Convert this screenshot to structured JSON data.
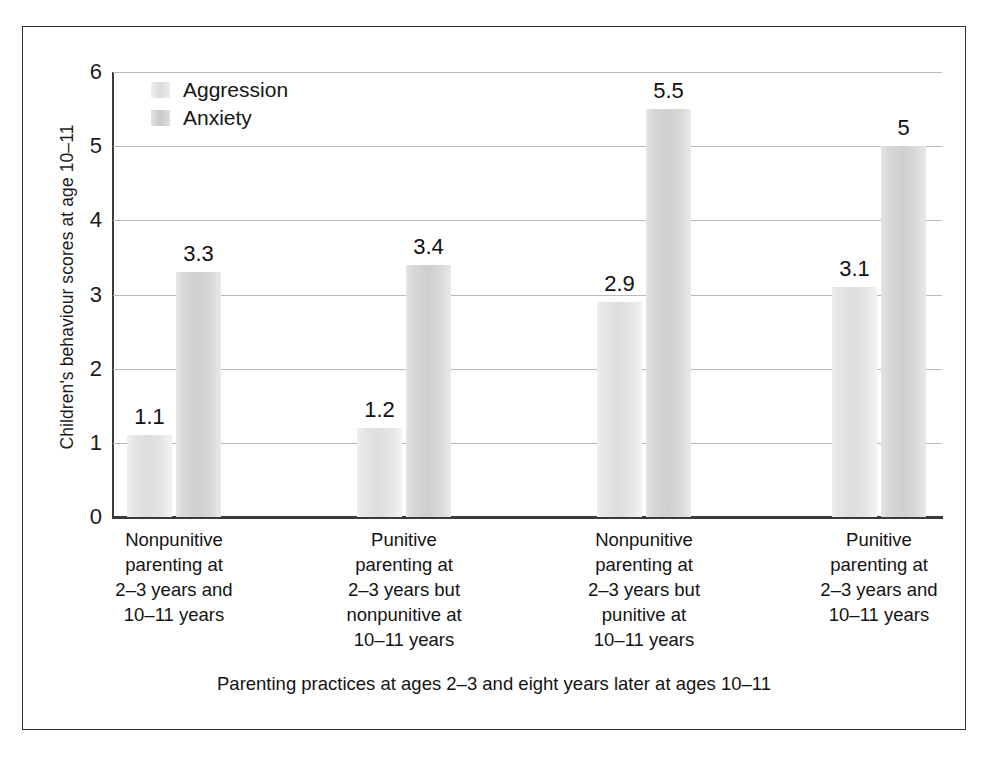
{
  "chart_data": {
    "type": "bar",
    "title": "",
    "xlabel": "Parenting practices at ages 2–3 and eight years later at ages 10–11",
    "ylabel": "Children's behaviour scores at age 10–11",
    "ylim": [
      0,
      6
    ],
    "yticks": [
      "0",
      "1",
      "2",
      "3",
      "4",
      "5",
      "6"
    ],
    "grid": true,
    "legend_position": "top-left",
    "categories": [
      "Nonpunitive parenting at 2–3 years and 10–11 years",
      "Punitive parenting at 2–3 years but nonpunitive at 10–11 years",
      "Nonpunitive parenting at 2–3 years but punitive at 10–11 years",
      "Punitive parenting at 2–3 years and 10–11 years"
    ],
    "category_lines": [
      [
        "Nonpunitive",
        "parenting at",
        "2–3 years and",
        "10–11 years"
      ],
      [
        "Punitive",
        "parenting at",
        "2–3 years but",
        "nonpunitive at",
        "10–11 years"
      ],
      [
        "Nonpunitive",
        "parenting at",
        "2–3 years but",
        "punitive at",
        "10–11 years"
      ],
      [
        "Punitive",
        "parenting at",
        "2–3 years and",
        "10–11 years"
      ]
    ],
    "series": [
      {
        "name": "Aggression",
        "color": "#dedede",
        "values": [
          1.1,
          1.2,
          2.9,
          3.1
        ],
        "labels": [
          "1.1",
          "1.2",
          "2.9",
          "3.1"
        ]
      },
      {
        "name": "Anxiety",
        "color": "#cfcfcf",
        "values": [
          3.3,
          3.4,
          5.5,
          5.0
        ],
        "labels": [
          "3.3",
          "3.4",
          "5.5",
          "5"
        ]
      }
    ]
  },
  "legend": {
    "items": [
      {
        "label": "Aggression"
      },
      {
        "label": "Anxiety"
      }
    ]
  },
  "axes": {
    "y_title": "Children's behaviour scores at age 10–11",
    "x_title": "Parenting practices at ages 2–3 and eight years later at ages 10–11",
    "y_ticks": [
      "6",
      "5",
      "4",
      "3",
      "2",
      "1",
      "0"
    ]
  },
  "colors": {
    "aggression_bar": "#dedede",
    "anxiety_bar": "#cfcfcf",
    "gridline": "#b9b9b9",
    "axis": "#3a3a3a",
    "frame": "#2e2e2e",
    "text": "#1c1c1c",
    "background": "#ffffff"
  }
}
